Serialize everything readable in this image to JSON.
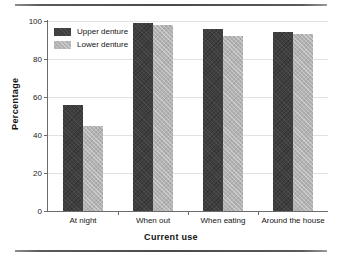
{
  "chart_data": {
    "type": "bar",
    "title": "",
    "xlabel": "Current use",
    "ylabel": "Percentage",
    "categories": [
      "At night",
      "When out",
      "When eating",
      "Around the house"
    ],
    "series": [
      {
        "name": "Upper denture",
        "color": "#3e3e3e",
        "values": [
          56,
          99,
          96,
          94
        ]
      },
      {
        "name": "Lower denture",
        "color": "#b2b2b2",
        "values": [
          45,
          98,
          92,
          93
        ]
      }
    ],
    "ylim": [
      0,
      100
    ],
    "yticks": [
      0,
      20,
      40,
      60,
      80,
      100
    ],
    "ytick_labels": [
      "0",
      "20",
      "40",
      "60",
      "80",
      "100"
    ],
    "grid": true,
    "legend_position": "top-left"
  }
}
